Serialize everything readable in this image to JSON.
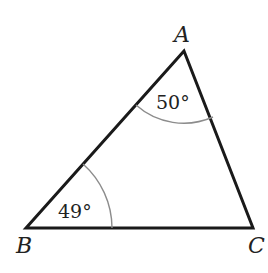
{
  "diagram": {
    "type": "triangle",
    "vertices": [
      {
        "name": "A",
        "label": "A"
      },
      {
        "name": "B",
        "label": "B"
      },
      {
        "name": "C",
        "label": "C"
      }
    ],
    "angles": [
      {
        "vertex": "A",
        "label": "50°"
      },
      {
        "vertex": "B",
        "label": "49°"
      }
    ],
    "colors": {
      "edges": "#1a1a1a",
      "arcs": "#8c8c8c",
      "text": "#222222"
    }
  }
}
